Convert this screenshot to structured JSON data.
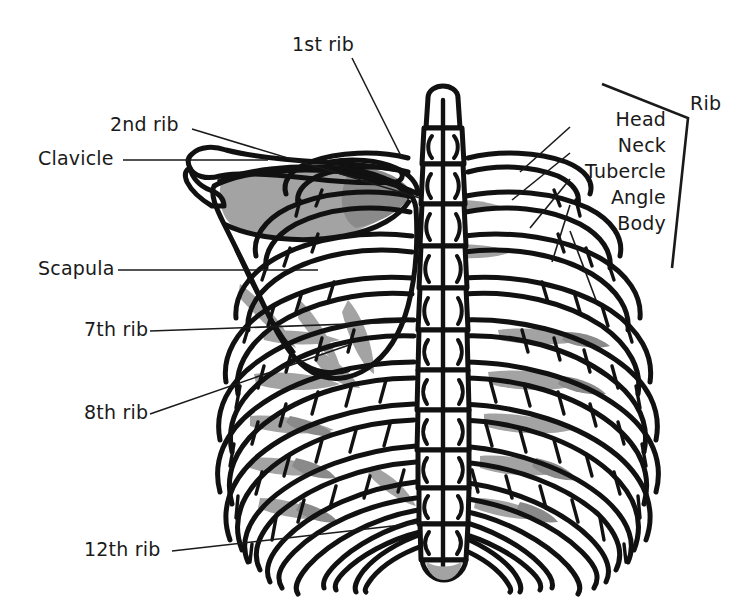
{
  "figure": {
    "background_color": "#ffffff",
    "line_color": "#111111",
    "shade_color": "#a3a3a3"
  },
  "labels_left": [
    {
      "id": "first-rib",
      "text": "1st rib",
      "x": 292,
      "y": 51
    },
    {
      "id": "second-rib",
      "text": "2nd rib",
      "x": 110,
      "y": 131
    },
    {
      "id": "clavicle",
      "text": "Clavicle",
      "x": 38,
      "y": 165
    },
    {
      "id": "scapula",
      "text": "Scapula",
      "x": 38,
      "y": 275
    },
    {
      "id": "seventh-rib",
      "text": "7th rib",
      "x": 84,
      "y": 336
    },
    {
      "id": "eighth-rib",
      "text": "8th rib",
      "x": 84,
      "y": 419
    },
    {
      "id": "twelfth-rib",
      "text": "12th rib",
      "x": 84,
      "y": 556
    }
  ],
  "labels_right": [
    {
      "id": "head",
      "text": "Head",
      "x": 666,
      "y": 126
    },
    {
      "id": "neck",
      "text": "Neck",
      "x": 666,
      "y": 152
    },
    {
      "id": "tubercle",
      "text": "Tubercle",
      "x": 666,
      "y": 178
    },
    {
      "id": "angle",
      "text": "Angle",
      "x": 666,
      "y": 204
    },
    {
      "id": "body",
      "text": "Body",
      "x": 666,
      "y": 230
    }
  ],
  "bracket_label": {
    "id": "rib",
    "text": "Rib",
    "x": 690,
    "y": 110
  }
}
